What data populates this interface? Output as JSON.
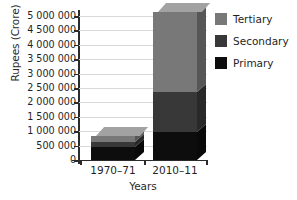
{
  "chart_data": {
    "type": "bar",
    "subtype": "stacked-3d-column",
    "title": "",
    "xlabel": "Years",
    "ylabel": "Rupees (Crore)",
    "categories": [
      "1970–71",
      "2010–11"
    ],
    "series": [
      {
        "name": "Primary",
        "color": "#0d0d0d",
        "values": [
          450000,
          975000
        ]
      },
      {
        "name": "Secondary",
        "color": "#383838",
        "values": [
          170000,
          1385000
        ]
      },
      {
        "name": "Tertiary",
        "color": "#787878",
        "values": [
          200000,
          2780000
        ]
      }
    ],
    "totals": [
      820000,
      5140000
    ],
    "ylim": [
      0,
      5000000
    ],
    "ytick_values": [
      0,
      500000,
      1000000,
      1500000,
      2000000,
      2500000,
      3000000,
      3500000,
      4000000,
      4500000,
      5000000
    ],
    "ytick_labels": [
      "0",
      "500 000",
      "1 000 000",
      "1 500 000",
      "2 000 000",
      "2 500 000",
      "3 000 000",
      "3 500 000",
      "4 000 000",
      "4 500 000",
      "5 000 000"
    ],
    "grid": true,
    "grid_axis": "y",
    "legend_position": "right",
    "legend_entries": [
      "Tertiary",
      "Secondary",
      "Primary"
    ]
  },
  "axes": {
    "y_title": "Rupees (Crore)",
    "x_title": "Years"
  },
  "xticks": [
    {
      "label": "1970–71"
    },
    {
      "label": "2010–11"
    }
  ],
  "legend": {
    "items": [
      {
        "label": "Tertiary",
        "color": "#787878"
      },
      {
        "label": "Secondary",
        "color": "#383838"
      },
      {
        "label": "Primary",
        "color": "#0d0d0d"
      }
    ]
  },
  "colors": {
    "tertiary": "#787878",
    "secondary": "#383838",
    "primary": "#0d0d0d",
    "axis": "#2b2b2b",
    "grid": "#d9d9d9",
    "background": "#ffffff"
  }
}
